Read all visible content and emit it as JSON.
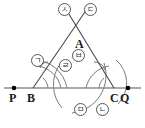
{
  "figure": {
    "type": "geometry-construction",
    "colors": {
      "baseline": "#8c8c8c",
      "construction_line": "#4a4a4a",
      "arc": "#6b6b6b",
      "point_dot": "#000000",
      "label_text": "#1a1a1a",
      "circle_label_border": "#555555",
      "background": "#ffffff"
    },
    "baseline": {
      "name": "line-PQ",
      "y": 88,
      "x_start": 4,
      "x_end": 141
    },
    "points": [
      {
        "id": "P",
        "label": "P",
        "x": 14,
        "y": 88,
        "dot": true,
        "label_x": 9,
        "label_y": 92
      },
      {
        "id": "B",
        "label": "B",
        "x": 33,
        "y": 88,
        "dot": false,
        "label_x": 27,
        "label_y": 92
      },
      {
        "id": "C",
        "label": "C",
        "x": 114,
        "y": 88,
        "dot": false,
        "label_x": 110,
        "label_y": 92
      },
      {
        "id": "Q",
        "label": "Q",
        "x": 128,
        "y": 88,
        "dot": true,
        "label_x": 120,
        "label_y": 92
      },
      {
        "id": "A",
        "label": "A",
        "x": 79,
        "y": 44,
        "dot": false,
        "label_x": 75,
        "label_y": 38
      }
    ],
    "circled_labels": [
      {
        "id": "giyeok",
        "text": "ㄱ",
        "x": 31,
        "y": 54,
        "note": "arc label on ray BA, left"
      },
      {
        "id": "digeut",
        "text": "ㄷ",
        "x": 84,
        "y": 3,
        "note": "upper ray from B extended"
      },
      {
        "id": "siot",
        "text": "ㅅ",
        "x": 58,
        "y": 3,
        "note": "upper ray from C extended"
      },
      {
        "id": "rieul",
        "text": "ㄹ",
        "x": 59,
        "y": 59,
        "note": "intersection marker near center"
      },
      {
        "id": "bieup",
        "text": "ㅂ",
        "x": 72,
        "y": 49,
        "note": "arc label right of center"
      },
      {
        "id": "mieum",
        "text": "ㅁ",
        "x": 74,
        "y": 103,
        "note": "arc label below baseline, center"
      },
      {
        "id": "nieun",
        "text": "ㄴ",
        "x": 96,
        "y": 103,
        "note": "arc label below baseline, right"
      }
    ]
  }
}
